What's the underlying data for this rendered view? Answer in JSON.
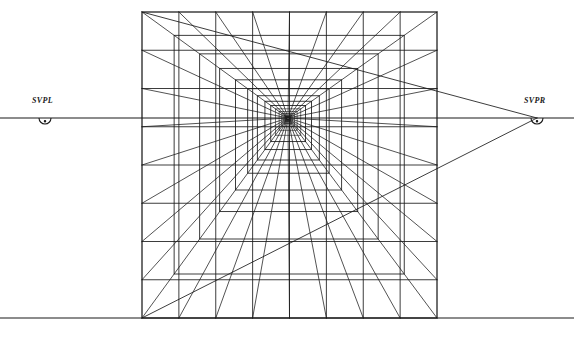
{
  "diagram": {
    "type": "perspective-construction-drawing",
    "background_color": "#ffffff",
    "line_color": "#1a1a1a",
    "canvas": {
      "width": 574,
      "height": 339
    }
  },
  "labels": {
    "left_vanishing_point": "SVPL",
    "right_vanishing_point": "SVPR"
  },
  "chart_data": {
    "type": "diagram",
    "horizon_line": {
      "y": 118,
      "x_start": 0,
      "x_end": 574
    },
    "ground_line": {
      "y": 318,
      "x_start": 0,
      "x_end": 574
    },
    "central_vanishing_point": {
      "x": 288,
      "y": 118,
      "label": "VP"
    },
    "special_vanishing_points": [
      {
        "label": "SVPL",
        "x": 45,
        "y": 118,
        "marker": "semicircle-below",
        "radius": 6
      },
      {
        "label": "SVPR",
        "x": 537,
        "y": 118,
        "marker": "semicircle-below",
        "radius": 6
      }
    ],
    "outer_rectangle": {
      "left": 142,
      "top": 12,
      "right": 437,
      "bottom": 318
    },
    "depth_plane_scales": [
      1.0,
      0.78,
      0.605,
      0.468,
      0.36,
      0.276,
      0.21,
      0.158,
      0.118,
      0.086,
      0.061,
      0.042,
      0.027,
      0.016,
      0.008
    ],
    "front_face_divisions": {
      "horizontal_count": 8,
      "vertical_count": 8
    },
    "orthogonal_ray_count": 34,
    "svpr_converging_lines": 2,
    "grid": "on",
    "legend_position": "none"
  }
}
